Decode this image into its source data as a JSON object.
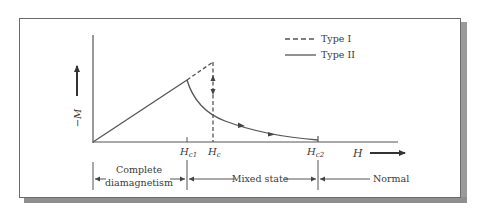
{
  "diagram": {
    "y_axis_label": "−M",
    "x_axis_label": "H",
    "legend": [
      {
        "label": "Type I",
        "style": "dashed"
      },
      {
        "label": "Type II",
        "style": "solid"
      }
    ],
    "ticks": {
      "hc1": {
        "main": "H",
        "sub": "c1"
      },
      "hc": {
        "main": "H",
        "sub": "c"
      },
      "hc2": {
        "main": "H",
        "sub": "c2"
      }
    },
    "regions": {
      "complete_line1": "Complete",
      "complete_line2": "diamagnetism",
      "mixed": "Mixed state",
      "normal": "Normal"
    },
    "colors": {
      "line": "#555555",
      "text": "#3a3a3a",
      "shadow": "#999999"
    }
  }
}
